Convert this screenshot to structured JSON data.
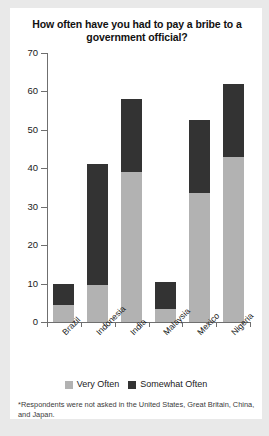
{
  "chart_data": {
    "type": "bar",
    "subtype": "stacked-vertical",
    "title": "How often have you had to pay a bribe to a government official?",
    "xlabel": "",
    "ylabel": "",
    "ylim": [
      0,
      70
    ],
    "yticks": [
      0,
      10,
      20,
      30,
      40,
      50,
      60,
      70
    ],
    "grid": false,
    "legend_position": "bottom",
    "categories": [
      "Brazil",
      "Indonesia",
      "India",
      "Malaysia",
      "Mexico",
      "Nigeria"
    ],
    "series": [
      {
        "name": "Very Often",
        "color": "#b2b2b2",
        "values": [
          4.5,
          9.5,
          39,
          3.5,
          33.5,
          43
        ]
      },
      {
        "name": "Somewhat Often",
        "color": "#333333",
        "values": [
          5.5,
          31.5,
          19,
          7,
          19,
          19
        ]
      }
    ],
    "totals": [
      10,
      41,
      58,
      10.5,
      52.5,
      62
    ],
    "annotations": [
      "*Respondents were not asked in the  United States, Great Britain, China, and Japan."
    ]
  },
  "footnote": {
    "text": "*Respondents were not asked in the  United States, Great Britain, China, and Japan."
  },
  "colors": {
    "page_background": "#e9e9e9",
    "card_background": "#ffffff",
    "axis": "#6f6f6f",
    "very_often": "#b2b2b2",
    "somewhat_often": "#333333",
    "text": "#1a1a1a"
  }
}
